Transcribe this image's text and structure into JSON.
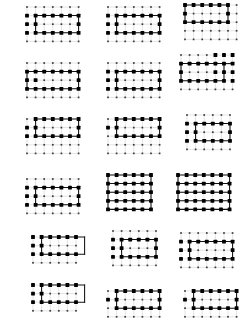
{
  "figure": {
    "title": "",
    "type": "lattice-panel-grid",
    "width": 248,
    "height": 332,
    "background_color": "#ffffff",
    "panel_count": 18,
    "columns": 3,
    "rows": 6,
    "legend": {
      "background_grid_label": "background lattice",
      "background_grid_color": "#c9c9c9",
      "background_node_color": "#3a3a3a",
      "background_node_radius": 0.85,
      "highlight_path_label": "highlighted sublattice",
      "highlight_path_color": "#111111",
      "highlight_node_color": "#000000",
      "highlight_node_radius": 1.9
    },
    "grid_spacing": 8.6
  },
  "chart_data": {
    "type": "scatter",
    "title": "",
    "xlabel": "",
    "ylabel": "",
    "grid": true,
    "legend_position": "none",
    "panels": [
      {
        "id": "panel-1",
        "row": 1,
        "col": 1,
        "x": 24,
        "y": 4,
        "bg_cols": 7,
        "bg_rows": 5,
        "bg_origin_x": 0,
        "bg_origin_y": 0,
        "rect": {
          "x0": 1,
          "y0": 1,
          "x1": 6,
          "y1": 3
        },
        "extra_nodes": [
          [
            0,
            1
          ],
          [
            0,
            2
          ],
          [
            0,
            3
          ],
          [
            6,
            1
          ],
          [
            6,
            2
          ],
          [
            6,
            3
          ]
        ],
        "shape": "rectangle"
      },
      {
        "id": "panel-2",
        "row": 1,
        "col": 2,
        "x": 105,
        "y": 4,
        "bg_cols": 7,
        "bg_rows": 5,
        "bg_origin_x": 0,
        "bg_origin_y": 0,
        "rect": {
          "x0": 1,
          "y0": 1,
          "x1": 6,
          "y1": 3
        },
        "extra_nodes": [
          [
            1,
            2
          ],
          [
            0,
            1
          ],
          [
            0,
            2
          ],
          [
            0,
            3
          ]
        ],
        "shape": "rectangle"
      },
      {
        "id": "panel-3",
        "row": 1,
        "col": 3,
        "x": 182,
        "y": 2,
        "bg_cols": 7,
        "bg_rows": 5,
        "bg_origin_x": 0,
        "bg_origin_y": 0,
        "rect": {
          "x0": 0,
          "y0": 0,
          "x1": 5,
          "y1": 2
        },
        "extra_nodes": [],
        "shape": "rectangle"
      },
      {
        "id": "panel-4",
        "row": 2,
        "col": 1,
        "x": 24,
        "y": 60,
        "bg_cols": 7,
        "bg_rows": 5,
        "bg_origin_x": 0,
        "bg_origin_y": 0,
        "rect": {
          "x0": 0,
          "y0": 1,
          "x1": 6,
          "y1": 3
        },
        "extra_nodes": [
          [
            1,
            2
          ]
        ],
        "shape": "rectangle"
      },
      {
        "id": "panel-5",
        "row": 2,
        "col": 2,
        "x": 105,
        "y": 60,
        "bg_cols": 7,
        "bg_rows": 5,
        "bg_origin_x": 0,
        "bg_origin_y": 0,
        "rect": {
          "x0": 1,
          "y0": 1,
          "x1": 6,
          "y1": 3
        },
        "extra_nodes": [
          [
            1,
            2
          ],
          [
            0,
            1
          ],
          [
            0,
            2
          ],
          [
            0,
            3
          ]
        ],
        "shape": "rectangle"
      },
      {
        "id": "panel-6",
        "row": 2,
        "col": 3,
        "x": 178,
        "y": 52,
        "bg_cols": 7,
        "bg_rows": 5,
        "bg_origin_x": 0,
        "bg_origin_y": 0,
        "rect": {
          "x0": 0,
          "y0": 1,
          "x1": 5,
          "y1": 3
        },
        "extra_nodes": [
          [
            4,
            0
          ],
          [
            5,
            0
          ],
          [
            6,
            0
          ],
          [
            6,
            1
          ],
          [
            6,
            2
          ],
          [
            6,
            3
          ],
          [
            4,
            1
          ],
          [
            4,
            2
          ]
        ],
        "shape": "l-shape"
      },
      {
        "id": "panel-7",
        "row": 3,
        "col": 1,
        "x": 24,
        "y": 116,
        "bg_cols": 7,
        "bg_rows": 5,
        "bg_origin_x": 0,
        "bg_origin_y": 0,
        "rect": {
          "x0": 1,
          "y0": 0,
          "x1": 6,
          "y1": 2
        },
        "extra_nodes": [
          [
            0,
            1
          ],
          [
            0,
            2
          ],
          [
            1,
            1
          ]
        ],
        "shape": "rectangle"
      },
      {
        "id": "panel-8",
        "row": 3,
        "col": 2,
        "x": 105,
        "y": 116,
        "bg_cols": 7,
        "bg_rows": 5,
        "bg_origin_x": 0,
        "bg_origin_y": 0,
        "rect": {
          "x0": 1,
          "y0": 0,
          "x1": 6,
          "y1": 2
        },
        "extra_nodes": [
          [
            1,
            1
          ],
          [
            0,
            1
          ]
        ],
        "shape": "rectangle"
      },
      {
        "id": "panel-9",
        "row": 3,
        "col": 3,
        "x": 184,
        "y": 112,
        "bg_cols": 6,
        "bg_rows": 5,
        "bg_origin_x": 0,
        "bg_origin_y": 0,
        "rect": {
          "x0": 1,
          "y0": 1,
          "x1": 5,
          "y1": 3
        },
        "extra_nodes": [
          [
            0,
            1
          ],
          [
            0,
            2
          ],
          [
            0,
            3
          ]
        ],
        "shape": "rectangle"
      },
      {
        "id": "panel-10",
        "row": 4,
        "col": 1,
        "x": 24,
        "y": 176,
        "bg_cols": 7,
        "bg_rows": 5,
        "bg_origin_x": 0,
        "bg_origin_y": 0,
        "rect": {
          "x0": 1,
          "y0": 1,
          "x1": 6,
          "y1": 3
        },
        "extra_nodes": [
          [
            0,
            1
          ],
          [
            0,
            2
          ],
          [
            0,
            3
          ]
        ],
        "shape": "rectangle"
      },
      {
        "id": "panel-11",
        "row": 4,
        "col": 2,
        "x": 105,
        "y": 172,
        "bg_cols": 6,
        "bg_rows": 5,
        "bg_origin_x": 0,
        "bg_origin_y": 0,
        "rect": {
          "x0": 0,
          "y0": 0,
          "x1": 5,
          "y1": 4
        },
        "extra_nodes": [
          [
            0,
            1
          ],
          [
            1,
            1
          ],
          [
            2,
            1
          ],
          [
            3,
            1
          ],
          [
            4,
            1
          ],
          [
            5,
            1
          ],
          [
            0,
            2
          ],
          [
            5,
            2
          ],
          [
            0,
            3
          ],
          [
            1,
            3
          ],
          [
            2,
            3
          ],
          [
            3,
            3
          ],
          [
            4,
            3
          ],
          [
            5,
            3
          ]
        ],
        "shape": "dense-rectangle"
      },
      {
        "id": "panel-12",
        "row": 4,
        "col": 3,
        "x": 175,
        "y": 172,
        "bg_cols": 7,
        "bg_rows": 5,
        "bg_origin_x": 0,
        "bg_origin_y": 0,
        "rect": {
          "x0": 0,
          "y0": 0,
          "x1": 6,
          "y1": 4
        },
        "extra_nodes": [
          [
            1,
            1
          ],
          [
            2,
            1
          ],
          [
            3,
            1
          ],
          [
            4,
            1
          ],
          [
            5,
            1
          ],
          [
            1,
            2
          ],
          [
            5,
            2
          ],
          [
            1,
            3
          ],
          [
            2,
            3
          ],
          [
            3,
            3
          ],
          [
            4,
            3
          ],
          [
            5,
            3
          ]
        ],
        "shape": "dense-rectangle"
      },
      {
        "id": "panel-13",
        "row": 5,
        "col": 1,
        "x": 30,
        "y": 234,
        "bg_cols": 6,
        "bg_rows": 4,
        "bg_origin_x": 0,
        "bg_origin_y": 0,
        "rect": {
          "x0": 1,
          "y0": 0,
          "x1": 6,
          "y1": 2
        },
        "extra_nodes": [
          [
            0,
            0
          ],
          [
            0,
            1
          ],
          [
            0,
            2
          ]
        ],
        "shape": "rectangle"
      },
      {
        "id": "panel-14",
        "row": 5,
        "col": 2,
        "x": 110,
        "y": 228,
        "bg_cols": 6,
        "bg_rows": 5,
        "bg_origin_x": 0,
        "bg_origin_y": 0,
        "rect": {
          "x0": 1,
          "y0": 1,
          "x1": 5,
          "y1": 3
        },
        "extra_nodes": [
          [
            0,
            1
          ],
          [
            0,
            2
          ],
          [
            0,
            3
          ]
        ],
        "shape": "rectangle"
      },
      {
        "id": "panel-15",
        "row": 5,
        "col": 3,
        "x": 178,
        "y": 230,
        "bg_cols": 7,
        "bg_rows": 5,
        "bg_origin_x": 0,
        "bg_origin_y": 0,
        "rect": {
          "x0": 1,
          "y0": 1,
          "x1": 6,
          "y1": 3
        },
        "extra_nodes": [
          [
            1,
            2
          ],
          [
            0,
            1
          ],
          [
            0,
            2
          ],
          [
            0,
            3
          ]
        ],
        "shape": "rectangle"
      },
      {
        "id": "panel-16",
        "row": 6,
        "col": 1,
        "x": 30,
        "y": 282,
        "bg_cols": 6,
        "bg_rows": 4,
        "bg_origin_x": 0,
        "bg_origin_y": 0,
        "rect": {
          "x0": 1,
          "y0": 0,
          "x1": 6,
          "y1": 2
        },
        "extra_nodes": [
          [
            0,
            0
          ],
          [
            0,
            1
          ],
          [
            0,
            2
          ]
        ],
        "shape": "rectangle"
      },
      {
        "id": "panel-17",
        "row": 6,
        "col": 2,
        "x": 105,
        "y": 288,
        "bg_cols": 7,
        "bg_rows": 4,
        "bg_origin_x": 0,
        "bg_origin_y": 0,
        "rect": {
          "x0": 1,
          "y0": 0,
          "x1": 6,
          "y1": 2
        },
        "extra_nodes": [
          [
            0,
            1
          ]
        ],
        "shape": "rectangle"
      },
      {
        "id": "panel-18",
        "row": 6,
        "col": 3,
        "x": 182,
        "y": 288,
        "bg_cols": 7,
        "bg_rows": 4,
        "bg_origin_x": 0,
        "bg_origin_y": 0,
        "rect": {
          "x0": 1,
          "y0": 0,
          "x1": 6,
          "y1": 2
        },
        "extra_nodes": [
          [
            0,
            1
          ]
        ],
        "shape": "rectangle"
      }
    ]
  }
}
